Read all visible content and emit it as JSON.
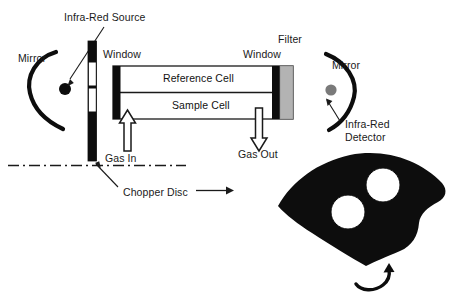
{
  "diagram": {
    "colors": {
      "ink": "#111111",
      "black": "#0d0d0d",
      "filter_gray": "#b3b3b3",
      "detector_gray": "#7a7a7a",
      "white": "#ffffff"
    },
    "labels": {
      "infra_red_source": "Infra-Red Source",
      "mirror_left": "Mirror",
      "window_left": "Window",
      "reference_cell": "Reference Cell",
      "sample_cell": "Sample Cell",
      "gas_in": "Gas In",
      "gas_out": "Gas Out",
      "chopper_disc": "Chopper Disc",
      "window_right": "Window",
      "filter": "Filter",
      "mirror_right": "Mirror",
      "infra_red_detector_line1": "Infra-Red",
      "infra_red_detector_line2": "Detector"
    },
    "components": [
      {
        "name": "mirror-left",
        "type": "concave-mirror",
        "label": "Mirror"
      },
      {
        "name": "infra-red-source",
        "type": "point-source",
        "label": "Infra-Red Source"
      },
      {
        "name": "chopper-blade-bar",
        "type": "vertical-bar-with-slots",
        "label": "Chopper Disc"
      },
      {
        "name": "window-left",
        "type": "black-bar",
        "label": "Window"
      },
      {
        "name": "reference-cell",
        "type": "chamber",
        "label": "Reference Cell"
      },
      {
        "name": "sample-cell",
        "type": "chamber",
        "label": "Sample Cell"
      },
      {
        "name": "gas-in-arrow",
        "type": "outline-arrow-up",
        "label": "Gas In"
      },
      {
        "name": "gas-out-arrow",
        "type": "outline-arrow-down",
        "label": "Gas Out"
      },
      {
        "name": "window-right",
        "type": "black-bar",
        "label": "Window"
      },
      {
        "name": "filter",
        "type": "gray-bar",
        "label": "Filter"
      },
      {
        "name": "mirror-right",
        "type": "concave-mirror",
        "label": "Mirror"
      },
      {
        "name": "infra-red-detector",
        "type": "point-detector",
        "label": "Infra-Red Detector"
      },
      {
        "name": "chopper-disc-sector",
        "type": "fan-sector-with-two-holes",
        "label": "Chopper Disc"
      },
      {
        "name": "rotation-arrow",
        "type": "curved-arrow",
        "label": "rotation"
      },
      {
        "name": "optical-axis",
        "type": "dash-dot-line",
        "label": "optical axis"
      }
    ]
  }
}
